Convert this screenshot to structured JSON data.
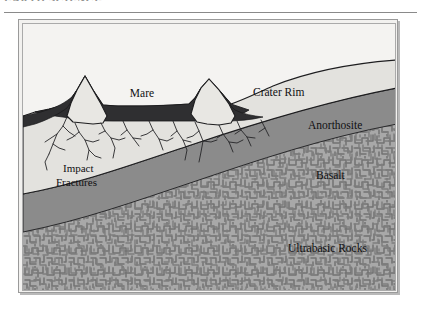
{
  "page": {
    "cropped_header_text": "EARTH SCIENCE",
    "background_color": "#ffffff"
  },
  "figure": {
    "title": "Cross Section of the Moon",
    "frame_color": "#9a9a9a",
    "background_color": "#f4f3f1",
    "labels": {
      "mare": "Mare",
      "crater_rim": "Crater Rim",
      "anorthosite": "Anorthosite",
      "basalt": "Basalt",
      "impact_fractures_line1": "Impact",
      "impact_fractures_line2": "Fractures",
      "ultrabasic_rocks": "Ultrabasic Rocks"
    },
    "layer_colors": {
      "sky": "#f4f3f1",
      "mare": "#2f2f31",
      "anorthosite": "#e2e1dd",
      "basalt": "#8b8b8b",
      "ultrabasic": "#a5a5a5",
      "ultrabasic_pattern": "#7b7b7b",
      "outline": "#1b1b1d"
    }
  }
}
